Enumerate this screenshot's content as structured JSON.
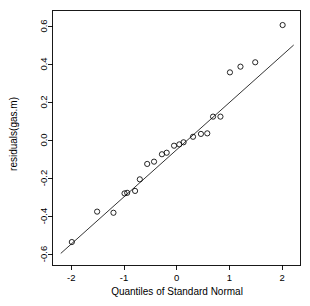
{
  "chart_data": {
    "type": "scatter",
    "title": "",
    "subtitle": "",
    "xlabel": "Quantiles of Standard Normal",
    "ylabel": "residuals(gas.m)",
    "xlim": [
      -2.35,
      2.35
    ],
    "ylim": [
      -0.66,
      0.68
    ],
    "xticks": [
      -2,
      -1,
      0,
      1,
      2
    ],
    "xtick_labels": [
      "-2",
      "-1",
      "0",
      "1",
      "2"
    ],
    "yticks": [
      0.6,
      0.4,
      0.2,
      0.0,
      -0.2,
      -0.4,
      -0.6
    ],
    "ytick_labels": [
      "0.6",
      "0.4",
      "0.2",
      "0.0",
      "-0.2",
      "-0.4",
      "-0.6"
    ],
    "grid": false,
    "legend": null,
    "marker": "open-circle",
    "marker_color": "#000000",
    "point_count": 23,
    "x": [
      -1.99,
      -1.51,
      -1.2,
      -0.99,
      -0.94,
      -0.79,
      -0.7,
      -0.56,
      -0.43,
      -0.28,
      -0.19,
      -0.05,
      0.05,
      0.13,
      0.31,
      0.46,
      0.58,
      0.69,
      0.83,
      1.01,
      1.21,
      1.49,
      2.01
    ],
    "y": [
      -0.537,
      -0.377,
      -0.383,
      -0.281,
      -0.278,
      -0.268,
      -0.207,
      -0.126,
      -0.114,
      -0.075,
      -0.067,
      -0.03,
      -0.023,
      -0.012,
      0.017,
      0.032,
      0.035,
      0.123,
      0.123,
      0.356,
      0.386,
      0.409,
      0.605
    ],
    "reference_line": {
      "label": "qqline",
      "x": [
        -2.2,
        2.22
      ],
      "y": [
        -0.597,
        0.5
      ],
      "color": "#000000"
    }
  },
  "axes": {
    "x_title": "Quantiles of Standard Normal",
    "y_title": "residuals(gas.m)"
  }
}
